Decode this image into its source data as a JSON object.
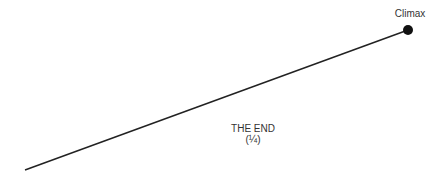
{
  "diagram": {
    "climax_label": "Climax",
    "end_label_line1": "THE END",
    "end_label_line2": "(¼)",
    "line": {
      "x1": 25,
      "y1": 170,
      "x2": 408,
      "y2": 30,
      "color": "#222222"
    },
    "point": {
      "cx": 408,
      "cy": 30,
      "r": 5,
      "color": "#111111"
    }
  }
}
